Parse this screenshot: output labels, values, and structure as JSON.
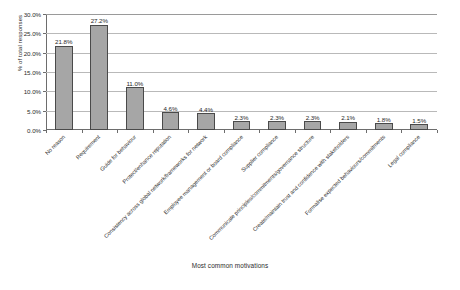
{
  "chart_data": {
    "type": "bar",
    "title": "",
    "xlabel": "Most common motivations",
    "ylabel": "% of total responses",
    "ylim": [
      0,
      30
    ],
    "ytick_labels": [
      "0.0%",
      "5.0%",
      "10.0%",
      "15.0%",
      "20.0%",
      "25.0%",
      "30.0%"
    ],
    "ytick_values": [
      0,
      5,
      10,
      15,
      20,
      25,
      30
    ],
    "grid": "horizontal",
    "legend": "none",
    "categories": [
      "No reason",
      "Requirement",
      "Guide for behaviour",
      "Protect/enhance reputation",
      "Consistency across global network/frameworks for network",
      "Employee management or board compliance",
      "Supplier compliance",
      "Communicate principles/commitments/governance structure",
      "Create/maintain trust and confidence with stakeholders",
      "Formalise expected behaviours/commitments",
      "Legal compliance"
    ],
    "values": [
      21.8,
      27.2,
      11.0,
      4.6,
      4.4,
      2.3,
      2.3,
      2.3,
      2.1,
      1.8,
      1.5
    ],
    "value_labels": [
      "21.8%",
      "27.2%",
      "11.0%",
      "4.6%",
      "4.4%",
      "2.3%",
      "2.3%",
      "2.3%",
      "2.1%",
      "1.8%",
      "1.5%"
    ],
    "bar_color": "#a6a6a6",
    "bar_border_color": "#4a4a4a",
    "gridline_color": "#b9b9b9",
    "axis_color": "#6d6d6d",
    "text_color": "#2b2b2b"
  }
}
